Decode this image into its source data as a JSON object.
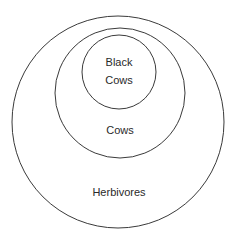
{
  "diagram": {
    "type": "nested-euler-diagram",
    "stroke_color": "#3a3a3a",
    "background": "#ffffff",
    "sets": [
      {
        "id": "herbivores",
        "label": "Herbivores",
        "cx": 118,
        "cy": 122,
        "r": 106
      },
      {
        "id": "cows",
        "label": "Cows",
        "cx": 120,
        "cy": 93,
        "r": 65
      },
      {
        "id": "black-cows",
        "label_line1": "Black",
        "label_line2": "Cows",
        "cx": 119,
        "cy": 72,
        "r": 37
      }
    ]
  }
}
